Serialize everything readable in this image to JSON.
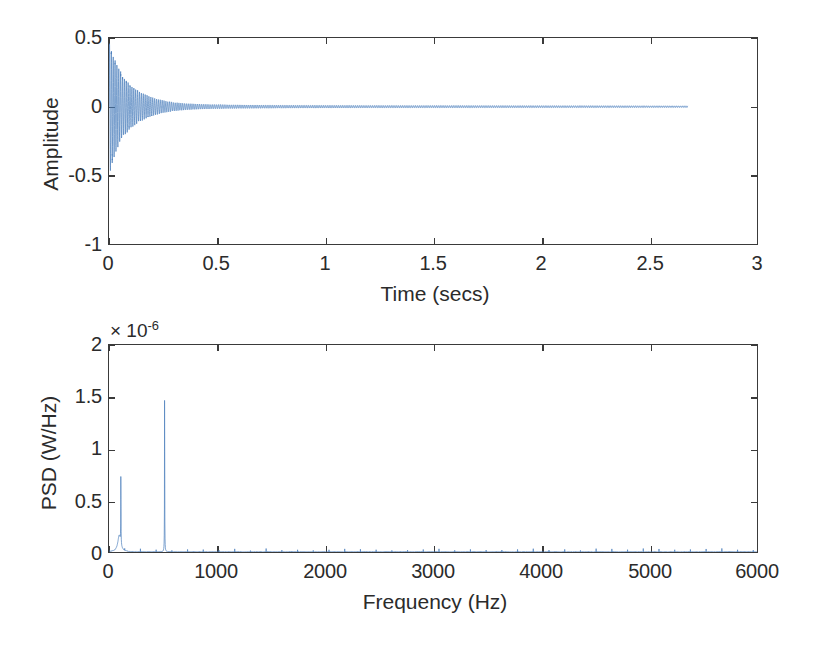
{
  "figure": {
    "background": "#ffffff",
    "line_color": "#4a7ebb",
    "axis_color": "#3a3a3a",
    "width": 814,
    "height": 645
  },
  "chart_data": [
    {
      "id": "time-domain",
      "type": "line",
      "title": "",
      "xlabel": "Time (secs)",
      "ylabel": "Amplitude",
      "xlim": [
        0,
        3
      ],
      "ylim": [
        -1,
        0.5
      ],
      "xticks": [
        0,
        0.5,
        1,
        1.5,
        2,
        2.5,
        3
      ],
      "xticklabels": [
        "0",
        "0.5",
        "1",
        "1.5",
        "2",
        "2.5",
        "3"
      ],
      "yticks": [
        0.5,
        0,
        -0.5,
        -1
      ],
      "yticklabels": [
        "0.5",
        "0",
        "-0.5",
        "-1"
      ],
      "grid": false,
      "legend": null,
      "series": [
        {
          "name": "signal",
          "color": "#4a7ebb",
          "description": "Damped oscillatory acoustic signal; exponentially decaying envelope starting at amplitude 0.5 at t=0 and decaying to near zero by t~0.35 s, small residual ringing persists to the signal end.",
          "data_extent_seconds": [
            0,
            2.68
          ],
          "envelope_points": [
            {
              "t": 0.0,
              "amp": 0.5
            },
            {
              "t": 0.008,
              "amp": 0.46
            },
            {
              "t": 0.018,
              "amp": 0.4
            },
            {
              "t": 0.03,
              "amp": 0.34
            },
            {
              "t": 0.045,
              "amp": 0.29
            },
            {
              "t": 0.06,
              "amp": 0.24
            },
            {
              "t": 0.08,
              "amp": 0.195
            },
            {
              "t": 0.1,
              "amp": 0.16
            },
            {
              "t": 0.125,
              "amp": 0.13
            },
            {
              "t": 0.15,
              "amp": 0.105
            },
            {
              "t": 0.18,
              "amp": 0.082
            },
            {
              "t": 0.21,
              "amp": 0.063
            },
            {
              "t": 0.25,
              "amp": 0.046
            },
            {
              "t": 0.3,
              "amp": 0.032
            },
            {
              "t": 0.36,
              "amp": 0.023
            },
            {
              "t": 0.45,
              "amp": 0.017
            },
            {
              "t": 0.6,
              "amp": 0.013
            },
            {
              "t": 0.8,
              "amp": 0.011
            },
            {
              "t": 1.2,
              "amp": 0.009
            },
            {
              "t": 1.8,
              "amp": 0.008
            },
            {
              "t": 2.4,
              "amp": 0.007
            },
            {
              "t": 2.68,
              "amp": 0.006
            }
          ],
          "carrier_frequency_hz": 115
        }
      ]
    },
    {
      "id": "psd",
      "type": "line",
      "title": "",
      "xlabel": "Frequency (Hz)",
      "ylabel": "PSD (W/Hz)",
      "y_exponent": "× 10",
      "y_exponent_power": "-6",
      "xlim": [
        0,
        6000
      ],
      "ylim": [
        0,
        2
      ],
      "y_scale_factor": 1e-06,
      "xticks": [
        0,
        1000,
        2000,
        3000,
        4000,
        5000,
        6000
      ],
      "xticklabels": [
        "0",
        "1000",
        "2000",
        "3000",
        "4000",
        "5000",
        "6000"
      ],
      "yticks": [
        0,
        0.5,
        1,
        1.5,
        2
      ],
      "yticklabels": [
        "0",
        "0.5",
        "1",
        "1.5",
        "2"
      ],
      "grid": false,
      "legend": null,
      "series": [
        {
          "name": "psd",
          "color": "#4a7ebb",
          "description": "Power spectral density with two dominant narrow peaks near 110 Hz and 515 Hz over a near-zero broadband floor.",
          "peaks": [
            {
              "frequency_hz": 110,
              "value": 0.77
            },
            {
              "frequency_hz": 515,
              "value": 1.76
            }
          ],
          "noise_floor": 0.01
        }
      ]
    }
  ]
}
